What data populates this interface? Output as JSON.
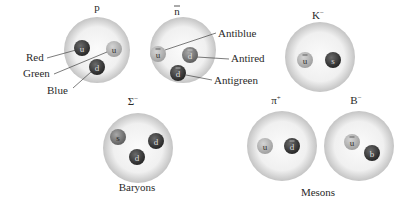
{
  "colors": {
    "hadron_outer": "#c9c9c9",
    "hadron_inner": "#f7f7f7",
    "quark_dark": "#3a3a3a",
    "quark_mid": "#7a7a7a",
    "quark_light": "#b4b4b4",
    "leader_line": "#444444"
  },
  "particles": [
    {
      "id": "p",
      "label": "p",
      "cx": 97,
      "cy": 50,
      "r": 33,
      "lx": 97,
      "ly": 11,
      "quarks": [
        {
          "sym": "u",
          "bar": false,
          "cx": 82,
          "cy": 48,
          "shade": "dark",
          "text": "#dddddd"
        },
        {
          "sym": "u",
          "bar": false,
          "cx": 114,
          "cy": 49,
          "shade": "light",
          "text": "#333333"
        },
        {
          "sym": "d",
          "bar": false,
          "cx": 97,
          "cy": 67,
          "shade": "dark",
          "text": "#dddddd"
        }
      ]
    },
    {
      "id": "nbar",
      "label": "n",
      "bar": true,
      "cx": 183,
      "cy": 50,
      "r": 33,
      "lx": 177,
      "ly": 15,
      "quarks": [
        {
          "sym": "u",
          "bar": true,
          "cx": 158,
          "cy": 54,
          "shade": "light",
          "text": "#333333"
        },
        {
          "sym": "d",
          "bar": true,
          "cx": 190,
          "cy": 55,
          "shade": "mid",
          "text": "#dddddd"
        },
        {
          "sym": "d",
          "bar": true,
          "cx": 178,
          "cy": 73,
          "shade": "dark",
          "text": "#dddddd"
        }
      ]
    },
    {
      "id": "kminus",
      "label": "K",
      "sup": "−",
      "cx": 320,
      "cy": 57,
      "r": 35,
      "lx": 318,
      "ly": 19,
      "quarks": [
        {
          "sym": "u",
          "bar": true,
          "cx": 305,
          "cy": 60,
          "shade": "light",
          "text": "#333333"
        },
        {
          "sym": "s",
          "bar": false,
          "cx": 333,
          "cy": 60,
          "shade": "dark",
          "text": "#dddddd"
        }
      ]
    },
    {
      "id": "sigmaminus",
      "label": "Σ",
      "sup": "−",
      "cx": 138,
      "cy": 148,
      "r": 35,
      "lx": 133,
      "ly": 105,
      "quarks": [
        {
          "sym": "s",
          "bar": false,
          "cx": 118,
          "cy": 137,
          "shade": "mid",
          "text": "#222222"
        },
        {
          "sym": "d",
          "bar": false,
          "cx": 156,
          "cy": 141,
          "shade": "dark",
          "text": "#dddddd"
        },
        {
          "sym": "d",
          "bar": false,
          "cx": 137,
          "cy": 157,
          "shade": "dark",
          "text": "#dddddd"
        }
      ]
    },
    {
      "id": "piplus",
      "label": "π",
      "sup": "+",
      "cx": 282,
      "cy": 146,
      "r": 35,
      "lx": 276,
      "ly": 104,
      "quarks": [
        {
          "sym": "u",
          "bar": false,
          "cx": 265,
          "cy": 146,
          "shade": "light",
          "text": "#333333"
        },
        {
          "sym": "d",
          "bar": true,
          "cx": 292,
          "cy": 146,
          "shade": "dark",
          "text": "#dddddd"
        }
      ]
    },
    {
      "id": "bminus",
      "label": "B",
      "sup": "−",
      "cx": 359,
      "cy": 146,
      "r": 35,
      "lx": 356,
      "ly": 104,
      "quarks": [
        {
          "sym": "u",
          "bar": true,
          "cx": 352,
          "cy": 142,
          "shade": "light",
          "text": "#333333"
        },
        {
          "sym": "b",
          "bar": false,
          "cx": 372,
          "cy": 153,
          "shade": "dark",
          "text": "#dddddd"
        }
      ]
    }
  ],
  "annotations": [
    {
      "text": "Red",
      "x": 26,
      "y": 61,
      "x1": 47,
      "y1": 58,
      "x2": 76,
      "y2": 50
    },
    {
      "text": "Green",
      "x": 23,
      "y": 77,
      "x1": 54,
      "y1": 74,
      "x2": 107,
      "y2": 52
    },
    {
      "text": "Blue",
      "x": 47,
      "y": 94,
      "x1": 73,
      "y1": 88,
      "x2": 91,
      "y2": 72
    },
    {
      "text": "Antiblue",
      "x": 218,
      "y": 37,
      "x1": 216,
      "y1": 33,
      "x2": 165,
      "y2": 50
    },
    {
      "text": "Antired",
      "x": 231,
      "y": 62,
      "x1": 229,
      "y1": 59,
      "x2": 197,
      "y2": 57
    },
    {
      "text": "Antigreen",
      "x": 214,
      "y": 84,
      "x1": 212,
      "y1": 80,
      "x2": 186,
      "y2": 75
    }
  ],
  "group_labels": [
    {
      "text": "Baryons",
      "x": 137,
      "y": 191
    },
    {
      "text": "Mesons",
      "x": 318,
      "y": 196
    }
  ]
}
